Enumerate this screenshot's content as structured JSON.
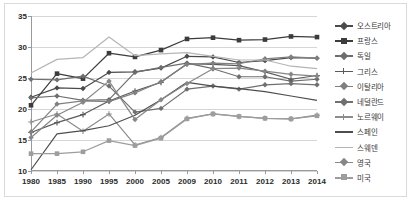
{
  "chart_data": {
    "type": "line",
    "title": "",
    "xlabel": "",
    "ylabel": "",
    "ylim": [
      10,
      35
    ],
    "yticks": [
      10,
      15,
      20,
      25,
      30,
      35
    ],
    "grid": true,
    "legend_position": "right",
    "categories": [
      "1980",
      "1985",
      "1990",
      "1995",
      "2000",
      "2005",
      "2009",
      "2010",
      "2011",
      "2012",
      "2013",
      "2014"
    ],
    "series": [
      {
        "name": "오스트리아",
        "color": "#4a4a4a",
        "marker": "diamond",
        "values": [
          21.9,
          23.4,
          23.3,
          25.9,
          26.0,
          26.6,
          28.5,
          28.4,
          27.5,
          27.8,
          28.3,
          28.2
        ]
      },
      {
        "name": "프랑스",
        "color": "#3c3c3c",
        "marker": "square",
        "values": [
          20.6,
          25.7,
          24.9,
          29.0,
          28.4,
          29.5,
          31.3,
          31.5,
          31.1,
          31.2,
          31.7,
          31.6
        ]
      },
      {
        "name": "독일",
        "color": "#6e6e6e",
        "marker": "diamond",
        "values": [
          21.8,
          22.1,
          21.4,
          21.5,
          25.9,
          26.7,
          27.4,
          26.5,
          25.2,
          25.2,
          24.5,
          24.8
        ]
      },
      {
        "name": "그리스",
        "color": "#5a5a5a",
        "marker": "plus",
        "values": [
          16.2,
          17.8,
          19.1,
          21.3,
          22.9,
          24.3,
          27.3,
          27.2,
          27.0,
          26.0,
          24.8,
          25.4
        ]
      },
      {
        "name": "이탈리아",
        "color": "#808080",
        "marker": "diamond",
        "values": [
          16.3,
          20.8,
          21.3,
          21.2,
          22.6,
          24.4,
          27.2,
          27.4,
          27.3,
          28.1,
          28.4,
          28.2
        ]
      },
      {
        "name": "네덜란드",
        "color": "#707070",
        "marker": "diamond",
        "values": [
          24.8,
          24.7,
          25.3,
          23.7,
          19.5,
          20.1,
          23.2,
          23.7,
          23.2,
          23.9,
          24.1,
          23.9
        ]
      },
      {
        "name": "노르웨이",
        "color": "#8c8c8c",
        "marker": "plus",
        "values": [
          17.9,
          19.2,
          16.4,
          19.2,
          14.2,
          15.4,
          18.5,
          19.2,
          18.8,
          18.5,
          18.4,
          19.0
        ]
      },
      {
        "name": "스페인",
        "color": "#4e4e4e",
        "marker": "none",
        "values": [
          10.2,
          16.0,
          16.5,
          17.3,
          19.0,
          21.5,
          24.3,
          23.7,
          23.3,
          22.8,
          22.1,
          21.4
        ]
      },
      {
        "name": "스웨덴",
        "color": "#b5b5b5",
        "marker": "none",
        "values": [
          25.8,
          28.0,
          28.3,
          31.6,
          28.6,
          28.9,
          29.1,
          28.5,
          27.9,
          27.9,
          26.9,
          26.5
        ]
      },
      {
        "name": "영국",
        "color": "#878787",
        "marker": "diamond",
        "values": [
          15.4,
          19.0,
          21.1,
          24.5,
          18.3,
          21.5,
          24.1,
          26.5,
          26.6,
          26.1,
          25.6,
          25.3
        ]
      },
      {
        "name": "미국",
        "color": "#9d9d9d",
        "marker": "square",
        "values": [
          12.8,
          12.8,
          13.1,
          14.9,
          14.1,
          15.3,
          18.4,
          19.2,
          18.8,
          18.5,
          18.4,
          18.9
        ]
      }
    ]
  }
}
